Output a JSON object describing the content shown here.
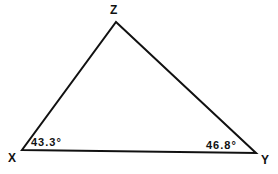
{
  "diagram": {
    "type": "triangle",
    "vertices": [
      {
        "name": "X",
        "label": "X",
        "angle": "43.3°"
      },
      {
        "name": "Y",
        "label": "Y",
        "angle": "46.8°"
      },
      {
        "name": "Z",
        "label": "Z"
      }
    ],
    "angle_labels": {
      "x": "43.3°",
      "y": "46.8°"
    },
    "colors": {
      "stroke": "#111111",
      "background": "#ffffff"
    }
  }
}
